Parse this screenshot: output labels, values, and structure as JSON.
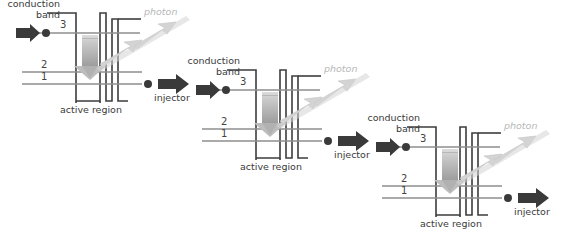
{
  "figure": {
    "type": "diagram",
    "background": "#ffffff",
    "cell_count": 3,
    "cell_offset": {
      "dx": 180,
      "dy": 57
    }
  },
  "labels": {
    "conduction": "conduction",
    "band": "band",
    "photon": "photon",
    "active_region": "active region",
    "injector": "injector",
    "level_3": "3",
    "level_2": "2",
    "level_1": "1"
  },
  "colors": {
    "band_line": "#3c3c3c",
    "level_line": "#8e8e8e",
    "electron_arrow": "#3a3a3a",
    "electron_dot": "#3a3a3a",
    "transition_arrow": "#b9b9b9",
    "photon_arrow": "#d2d2d2",
    "photon_text": "#b8b8b8",
    "text": "#3a3a3a",
    "well_fill_top": "#d6d6d6",
    "well_fill_bottom": "#9a9a9a"
  },
  "cells": [
    {
      "id": "cell-1",
      "x": 0,
      "y": 0,
      "conduction_label": "conduction",
      "band_label": "band",
      "photon_label": "photon",
      "active_region_label": "active region",
      "injector_label": "injector",
      "levels": [
        "3",
        "2",
        "1"
      ]
    },
    {
      "id": "cell-2",
      "x": 180,
      "y": 57,
      "conduction_label": "conduction",
      "band_label": "band",
      "photon_label": "photon",
      "active_region_label": "active region",
      "injector_label": "injector",
      "levels": [
        "3",
        "2",
        "1"
      ]
    },
    {
      "id": "cell-3",
      "x": 360,
      "y": 114,
      "conduction_label": "conduction",
      "band_label": "band",
      "photon_label": "photon",
      "active_region_label": "active region",
      "injector_label": "injector",
      "levels": [
        "3",
        "2",
        "1"
      ]
    }
  ]
}
